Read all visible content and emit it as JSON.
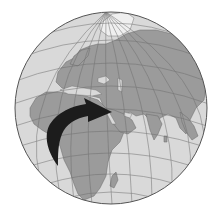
{
  "map": {
    "type": "orthographic-globe",
    "region_shown": "Europe, Africa, Middle East, Asia",
    "colors": {
      "background": "#ffffff",
      "ocean": "#d9d9d9",
      "land": "#9b9b9b",
      "ice": "#efefef",
      "graticule": "#6e6e6e",
      "outline": "#555555",
      "arrow": "#1c1c1c"
    },
    "arrow": {
      "description": "Migration arrow from central Africa to the Middle East",
      "from": "Central Africa",
      "to": "Arabian Peninsula / Middle East"
    }
  }
}
